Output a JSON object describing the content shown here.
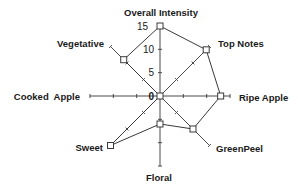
{
  "chart_data": {
    "type": "radar",
    "title": "",
    "axes": [
      "Overall Intensity",
      "Top Notes",
      "Ripe Apple",
      "GreenPeel",
      "Floral",
      "Sweet",
      "Cooked Apple",
      "Vegetative"
    ],
    "series": [
      {
        "name": "Profile",
        "values": [
          15,
          14,
          13,
          10,
          6,
          15,
          0,
          11
        ]
      }
    ],
    "scale": {
      "min": 0,
      "max": 15,
      "ticks": [
        0,
        5,
        10,
        15
      ]
    },
    "tick_labels": [
      "0",
      "5",
      "10",
      "15"
    ],
    "grid": false,
    "legend": "none",
    "marker": "open-square",
    "colors": {
      "line": "#3a3a3a",
      "axis": "#4a4a4a",
      "text": "#1a1a1a"
    }
  },
  "labels": {
    "overall_intensity": "Overall Intensity",
    "top_notes": "Top Notes",
    "ripe_apple": "Ripe Apple",
    "green_peel": "GreenPeel",
    "floral": "Floral",
    "sweet": "Sweet",
    "cooked_apple": "Cooked  Apple",
    "vegetative": "Vegetative"
  },
  "ticks": {
    "t0": "0",
    "t5": "5",
    "t10": "10",
    "t15": "15"
  }
}
